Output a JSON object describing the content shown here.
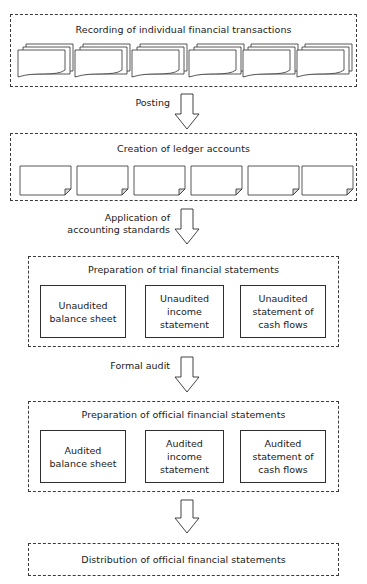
{
  "diagram": {
    "stroke_color": "#2e2e2e",
    "dash_color": "#3a3a3a",
    "background": "#ffffff"
  },
  "stages": [
    {
      "id": "recording",
      "title": "Recording of individual financial transactions",
      "icon": "document-stack-icon",
      "icon_count": 6
    },
    {
      "id": "ledger",
      "title": "Creation of ledger accounts",
      "icon": "folded-page-icon",
      "icon_count": 6
    },
    {
      "id": "trial",
      "title": "Preparation of trial financial statements",
      "boxes": [
        {
          "label": "Unaudited\nbalance sheet"
        },
        {
          "label": "Unaudited\nincome\nstatement"
        },
        {
          "label": "Unaudited\nstatement of\ncash flows"
        }
      ]
    },
    {
      "id": "official",
      "title": "Preparation of official financial statements",
      "boxes": [
        {
          "label": "Audited\nbalance sheet"
        },
        {
          "label": "Audited\nincome\nstatement"
        },
        {
          "label": "Audited\nstatement of\ncash flows"
        }
      ]
    },
    {
      "id": "distribution",
      "title": "Distribution of official financial statements"
    }
  ],
  "arrows": [
    {
      "id": "posting",
      "label": "Posting"
    },
    {
      "id": "standards",
      "label": "Application of\naccounting standards"
    },
    {
      "id": "audit",
      "label": "Formal audit"
    },
    {
      "id": "distribute",
      "label": ""
    }
  ]
}
